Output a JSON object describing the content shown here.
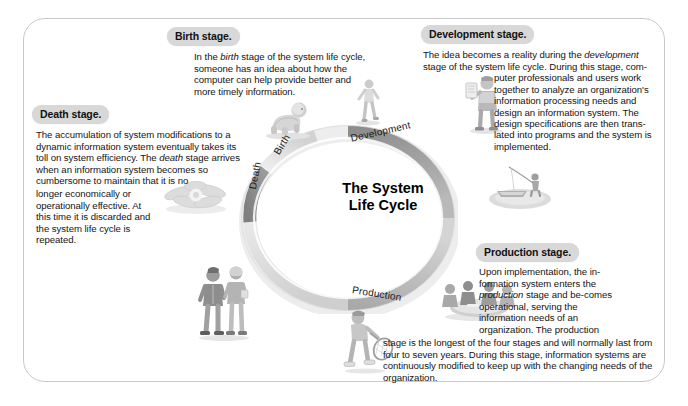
{
  "diagram": {
    "center_title_line1": "The System",
    "center_title_line2": "Life Cycle",
    "ring_segments": [
      {
        "name": "Birth",
        "label": "Birth",
        "tone": "#e6e6e6"
      },
      {
        "name": "Development",
        "label": "Development",
        "tone": "#9a9a9a"
      },
      {
        "name": "Production",
        "label": "Production",
        "tone": "#b4b4b4"
      },
      {
        "name": "Death",
        "label": "Death",
        "tone": "#8f8f8f"
      }
    ]
  },
  "stages": {
    "birth": {
      "badge": "Birth stage.",
      "body": "In the birth stage of the system life cycle, someone has an idea about how the computer can help provide better and more timely information.",
      "italic_phrase": "birth"
    },
    "death": {
      "badge": "Death stage.",
      "body": "The accumulation of system modifications to a dynamic information system eventually takes its toll on system efficiency. The death stage arrives when an information system becomes so cumbersome to maintain that it is no longer economically or operationally effective. At this time it is discarded and the system life cycle is repeated.",
      "italic_phrase": "death"
    },
    "development": {
      "badge": "Development stage.",
      "body": "The idea becomes a reality during the development stage of the system life cycle. During this stage, computer professionals and users work together to analyze an organization's information processing needs and design an information system. The design specifications are then translated into programs and the system is implemented.",
      "italic_phrase": "development"
    },
    "production": {
      "badge": "Production stage.",
      "body": "Upon implementation, the information system enters the production stage and becomes operational, serving the information needs of an organization. The production stage is the longest of the four stages and will normally last from four to seven years. During this stage, information systems are continuously modified to keep up with the changing needs of the organization.",
      "italic_phrase": "production"
    }
  },
  "illustrations": [
    {
      "name": "crawling-baby-illustration",
      "stage": "birth"
    },
    {
      "name": "jogger-illustration",
      "stage": "birth"
    },
    {
      "name": "person-with-blueprint-illustration",
      "stage": "development"
    },
    {
      "name": "fisherman-illustration",
      "stage": "development"
    },
    {
      "name": "meeting-table-illustration",
      "stage": "production"
    },
    {
      "name": "tennis-player-illustration",
      "stage": "production"
    },
    {
      "name": "walking-couple-illustration",
      "stage": "death"
    },
    {
      "name": "wilted-flower-illustration",
      "stage": "death"
    }
  ],
  "colors": {
    "frame_border": "#c9c9c9",
    "badge_bg": "#d8d8d8",
    "text": "#141414",
    "ring_dark": "#8f8f8f",
    "ring_light": "#e6e6e6"
  }
}
